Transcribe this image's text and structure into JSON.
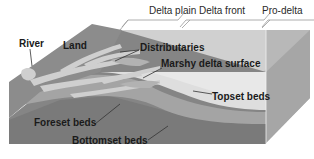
{
  "diagram": {
    "type": "block-diagram",
    "zones": [
      {
        "label": "Delta plain"
      },
      {
        "label": "Delta front"
      },
      {
        "label": "Pro-delta"
      }
    ],
    "labels": {
      "river": "River",
      "land": "Land",
      "distributaries": "Distributaries",
      "marshy": "Marshy delta surface",
      "topset": "Topset beds",
      "foreset": "Foreset beds",
      "bottomset": "Bottomset beds"
    },
    "colors": {
      "land": "#8a8a8a",
      "water_channels": "#cfcfcf",
      "top_surface": "#c8c8c8",
      "front_face_dark": "#7d7d7d",
      "foreset": "#a9a9a9",
      "topset": "#dcdcdc",
      "side_face": "#b5b5b5",
      "bracket": "#9a9a9a"
    }
  }
}
